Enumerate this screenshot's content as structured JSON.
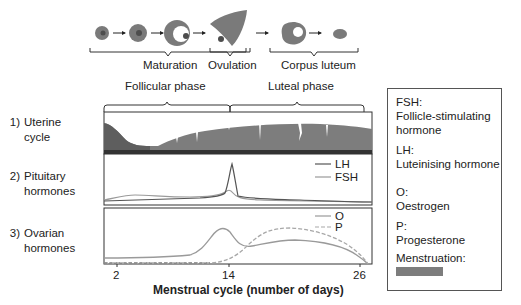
{
  "top_stages": {
    "maturation": "Maturation",
    "ovulation": "Ovulation",
    "corpus_luteum": "Corpus luteum"
  },
  "phases": {
    "follicular": "Follicular phase",
    "luteal": "Luteal phase"
  },
  "rows": [
    {
      "num": "1)",
      "line1": "Uterine",
      "line2": "cycle"
    },
    {
      "num": "2)",
      "line1": "Pituitary",
      "line2": "hormones"
    },
    {
      "num": "3)",
      "line1": "Ovarian",
      "line2": "hormones"
    }
  ],
  "pituitary_legend": {
    "lh": "LH",
    "fsh": "FSH"
  },
  "ovarian_legend": {
    "o": "O",
    "p": "P"
  },
  "x_axis": {
    "ticks": [
      "2",
      "14",
      "26"
    ],
    "title": "Menstrual cycle (number of days)"
  },
  "legend_box": {
    "fsh_abbr": "FSH:",
    "fsh_full_1": "Follicle-stimulating",
    "fsh_full_2": "hormone",
    "lh_abbr": "LH:",
    "lh_full": "Luteinising hormone",
    "o_abbr": "O:",
    "o_full": "Oestrogen",
    "p_abbr": "P:",
    "p_full": "Progesterone",
    "menstruation": "Menstruation:"
  },
  "colors": {
    "dark_line": "#555555",
    "light_line": "#9a9a9a",
    "endometrium": "#7d7d7d",
    "menses": "#5e5e5e",
    "follicle": "#7a7a7a"
  }
}
